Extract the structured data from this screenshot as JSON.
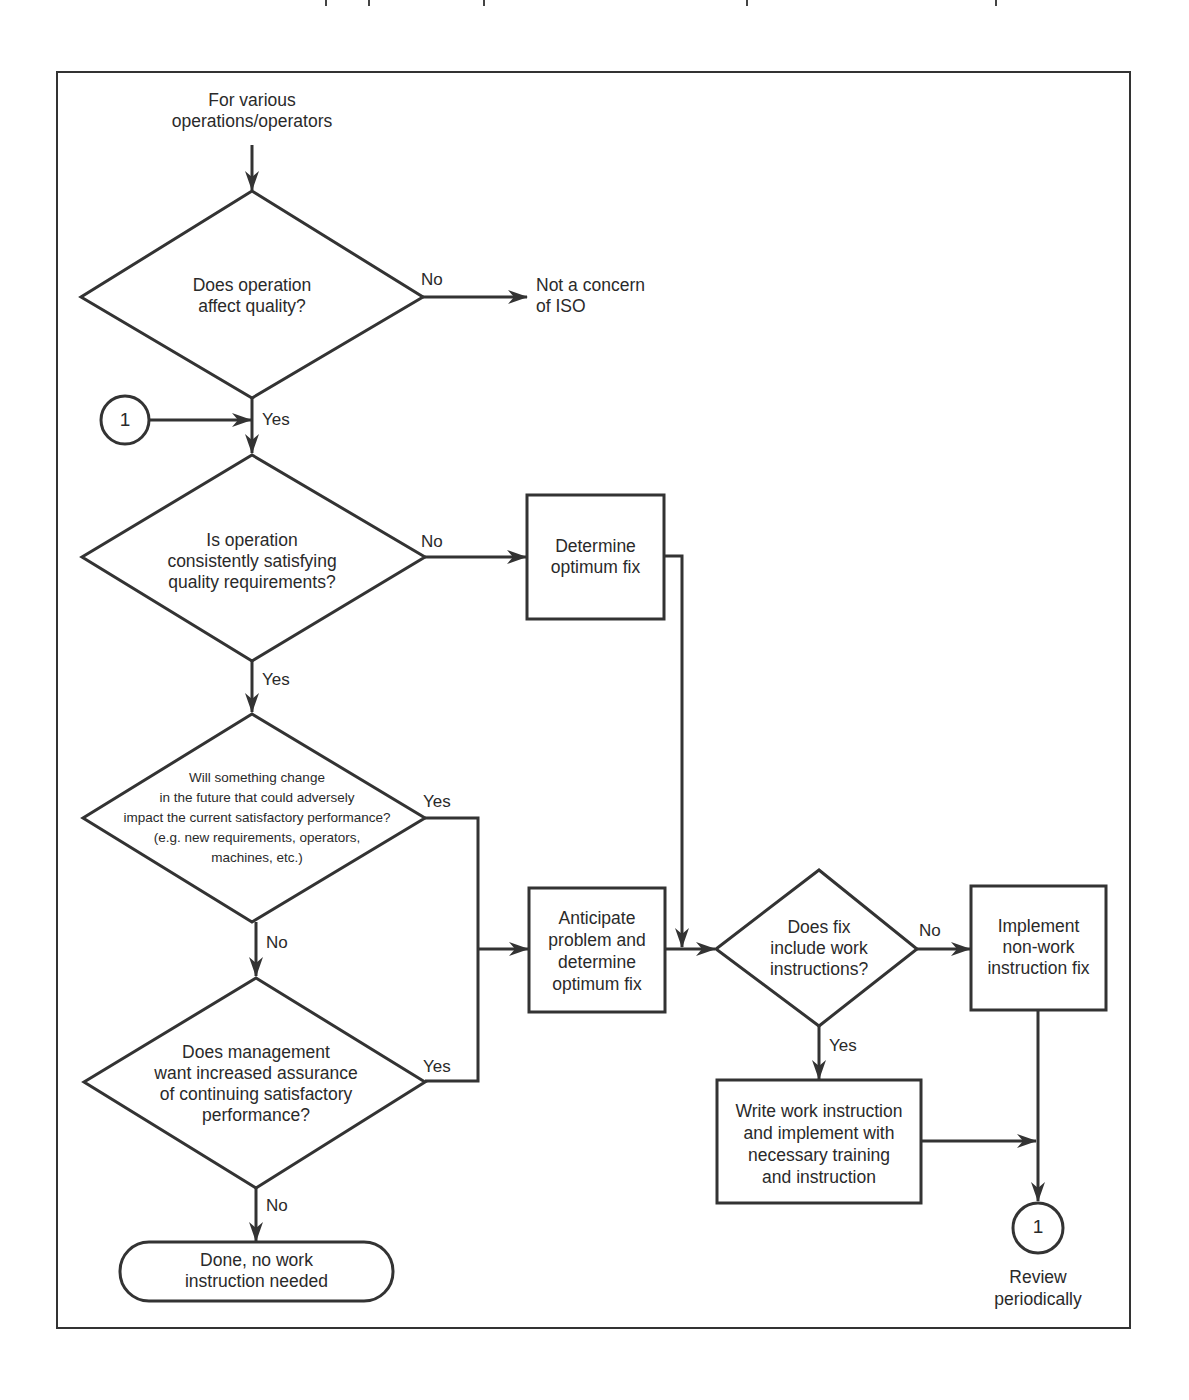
{
  "diagram": {
    "type": "flowchart",
    "start": {
      "text": "For various\noperations/operators"
    },
    "nodes": {
      "d1": {
        "shape": "diamond",
        "text": "Does operation\naffect quality?"
      },
      "t_not_iso": {
        "shape": "terminal-text",
        "text": "Not a concern\nof ISO"
      },
      "c1_in": {
        "shape": "connector",
        "text": "1"
      },
      "d2": {
        "shape": "diamond",
        "text": "Is operation\nconsistently satisfying\nquality requirements?"
      },
      "p_fix": {
        "shape": "process",
        "text": "Determine\noptimum fix"
      },
      "d3": {
        "shape": "diamond",
        "text": "Will something change\nin the future that could adversely\nimpact the current satisfactory performance?\n(e.g. new requirements, operators,\nmachines, etc.)"
      },
      "d4": {
        "shape": "diamond",
        "text": "Does management\nwant increased assurance\nof continuing satisfactory\nperformance?"
      },
      "t_done": {
        "shape": "terminator",
        "text": "Done, no work\ninstruction needed"
      },
      "p_anticipate": {
        "shape": "process",
        "text": "Anticipate\nproblem and\ndetermine\noptimum fix"
      },
      "d5": {
        "shape": "diamond",
        "text": "Does fix\ninclude work\ninstructions?"
      },
      "p_nonwork": {
        "shape": "process",
        "text": "Implement\nnon-work\ninstruction fix"
      },
      "p_write": {
        "shape": "process",
        "text": "Write work instruction\nand implement with\nnecessary training\nand instruction"
      },
      "c1_out": {
        "shape": "connector",
        "text": "1",
        "caption": "Review\nperiodically"
      }
    },
    "edges": [
      {
        "from": "start",
        "to": "d1",
        "label": ""
      },
      {
        "from": "d1",
        "to": "t_not_iso",
        "label": "No"
      },
      {
        "from": "d1",
        "to": "d2",
        "label": "Yes"
      },
      {
        "from": "c1_in",
        "to": "d2",
        "label": ""
      },
      {
        "from": "d2",
        "to": "p_fix",
        "label": "No"
      },
      {
        "from": "d2",
        "to": "d3",
        "label": "Yes"
      },
      {
        "from": "d3",
        "to": "p_anticipate",
        "label": "Yes"
      },
      {
        "from": "d3",
        "to": "d4",
        "label": "No"
      },
      {
        "from": "d4",
        "to": "p_anticipate",
        "label": "Yes"
      },
      {
        "from": "d4",
        "to": "t_done",
        "label": "No"
      },
      {
        "from": "p_fix",
        "to": "d5",
        "label": ""
      },
      {
        "from": "p_anticipate",
        "to": "d5",
        "label": ""
      },
      {
        "from": "d5",
        "to": "p_nonwork",
        "label": "No"
      },
      {
        "from": "d5",
        "to": "p_write",
        "label": "Yes"
      },
      {
        "from": "p_nonwork",
        "to": "c1_out",
        "label": ""
      },
      {
        "from": "p_write",
        "to": "c1_out",
        "label": ""
      }
    ],
    "branch_labels": {
      "yes": "Yes",
      "no": "No"
    }
  },
  "colors": {
    "line": "#333333",
    "text": "#2a2a2a",
    "background": "#ffffff"
  }
}
